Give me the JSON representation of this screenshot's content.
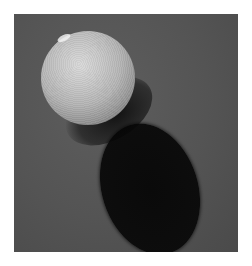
{
  "image": {
    "description": "Photograph of a textured gray sphere with its cast shadow on a dark gray surface",
    "colors": {
      "page_background": "#ffffff",
      "surface": "#545454",
      "sphere_light": "#d9d9d9",
      "sphere_dark": "#3a3a3a",
      "shadow": "#0d0d0d"
    }
  }
}
